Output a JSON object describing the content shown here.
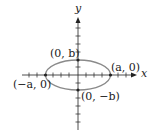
{
  "figure": {
    "type": "ellipse-diagram",
    "axes": {
      "x_label": "x",
      "y_label": "y"
    },
    "points": {
      "right_vertex": "(a, 0)",
      "left_vertex": "(−a, 0)",
      "top_covertex": "(0, b)",
      "bottom_covertex": "(0, −b)"
    },
    "colors": {
      "ellipse": "#8a8a8a",
      "axes": "#222222"
    }
  }
}
